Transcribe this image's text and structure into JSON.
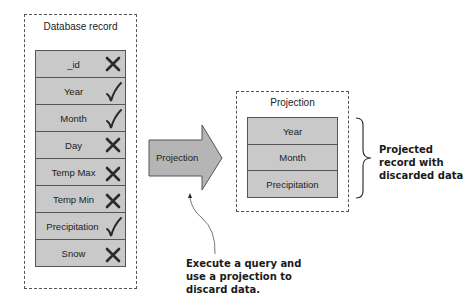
{
  "database_record": {
    "title": "Database record",
    "fields": [
      {
        "label": "_id",
        "mark": "cross-icon"
      },
      {
        "label": "Year",
        "mark": "check-icon"
      },
      {
        "label": "Month",
        "mark": "check-icon"
      },
      {
        "label": "Day",
        "mark": "cross-icon"
      },
      {
        "label": "Temp Max",
        "mark": "cross-icon"
      },
      {
        "label": "Temp Min",
        "mark": "cross-icon"
      },
      {
        "label": "Precipitation",
        "mark": "check-icon"
      },
      {
        "label": "Snow",
        "mark": "cross-icon"
      }
    ]
  },
  "arrow": {
    "label": "Projection"
  },
  "projection": {
    "title": "Projection",
    "fields": [
      {
        "label": "Year"
      },
      {
        "label": "Month"
      },
      {
        "label": "Precipitation"
      }
    ]
  },
  "annotations": {
    "projected_note": [
      "Projected",
      "record with",
      "discarded data"
    ],
    "query_note": [
      "Execute a query and",
      "use a projection to",
      "discard data."
    ]
  },
  "colors": {
    "field_fill": "#c9c9c9",
    "arrow_fill": "#b5b5b5",
    "border": "#555555"
  }
}
